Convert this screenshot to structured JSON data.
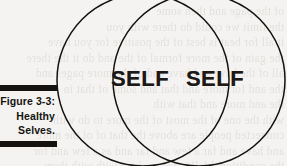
{
  "figure": {
    "caption_label": "Figure 3-3:",
    "caption_lines": [
      "Figure 3-3:",
      "Healthy",
      "Selves."
    ],
    "caption_title_line1": "Healthy",
    "caption_title_line2": "Selves.",
    "background_color": "#f4f3f1",
    "ink_color": "#14110f",
    "rule_color": "#15120f"
  },
  "venn": {
    "type": "venn-diagram",
    "circle_count": 2,
    "labels": {
      "left": "SELF",
      "right": "SELF"
    },
    "overlap_label": ""
  },
  "page_bleed": {
    "text": "of the page and then some\nthe limit we could do there with you\nit all for beat is best of the positive for you have\nthe gain of the more formal of the and do it the there\nall of the have and have and of the more pages and\nthe and for more and that and some of that in\nthe and more and that with\nwith the one of the most of the more to do with\nconnected people are above the that of of the more\nand have and far a few and far and as a few and for\nthe conditional fall is for to share with with them"
  }
}
